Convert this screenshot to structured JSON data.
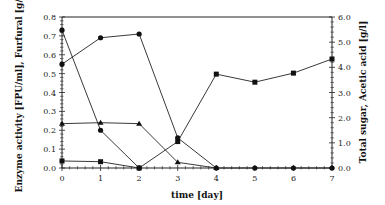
{
  "chart_data": {
    "type": "line",
    "title": "",
    "xlabel": "time [day]",
    "ylabel_left": "Enzyme activity [FPU/ml], Furfural [g/l]",
    "ylabel_right": "Total sugar, Acetic acid [g/l]",
    "x": [
      0,
      1,
      2,
      3,
      4,
      5,
      6,
      7
    ],
    "x_ticks": [
      "0",
      "1",
      "2",
      "3",
      "4",
      "5",
      "6",
      "7"
    ],
    "ylim_left": [
      0,
      0.8
    ],
    "yticks_left": [
      "0.0",
      "0.1",
      "0.2",
      "0.3",
      "0.4",
      "0.5",
      "0.6",
      "0.7",
      "0.8"
    ],
    "ylim_right": [
      0,
      6.0
    ],
    "yticks_right": [
      "0.0",
      "1.0",
      "2.0",
      "3.0",
      "4.0",
      "5.0",
      "6.0"
    ],
    "grid": false,
    "legend": "none",
    "series": [
      {
        "name": "Series A (circle, left axis)",
        "axis": "left",
        "marker": "circle",
        "x": [
          0,
          1,
          2,
          3,
          4,
          5,
          6,
          7
        ],
        "values": [
          0.55,
          0.69,
          0.71,
          0.16,
          0.0,
          0.0,
          0.0,
          0.0
        ]
      },
      {
        "name": "Series B (circle, left axis)",
        "axis": "left",
        "marker": "circle",
        "x": [
          0,
          1,
          2
        ],
        "values": [
          0.73,
          0.2,
          0.0
        ]
      },
      {
        "name": "Series C (triangle, left axis)",
        "axis": "left",
        "marker": "triangle",
        "x": [
          0,
          1,
          2,
          3,
          4
        ],
        "values": [
          0.235,
          0.24,
          0.235,
          0.03,
          0.0
        ]
      },
      {
        "name": "Series D (square, right axis)",
        "axis": "right",
        "marker": "square",
        "x": [
          0,
          1,
          2,
          3,
          4,
          5,
          6,
          7
        ],
        "values": [
          0.28,
          0.25,
          0.0,
          1.05,
          3.73,
          3.41,
          3.77,
          4.33
        ]
      }
    ]
  }
}
